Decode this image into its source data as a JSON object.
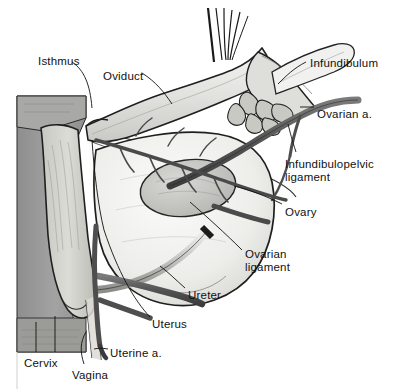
{
  "figure": {
    "background_color": "#ffffff",
    "ink_color": "#111111",
    "palette": {
      "panel_gray": "#9a9a9a",
      "tissue_light": "#e9e9e6",
      "tissue_mid": "#cccccc",
      "vessel_dark": "#5e5e5e",
      "outline": "#1a1a1a"
    }
  },
  "labels": [
    {
      "id": "isthmus",
      "text": "Isthmus",
      "x": 38,
      "y": 55,
      "align": "left"
    },
    {
      "id": "oviduct",
      "text": "Oviduct",
      "x": 103,
      "y": 70,
      "align": "left"
    },
    {
      "id": "infundibulum",
      "text": "Infundibulum",
      "x": 310,
      "y": 57,
      "align": "left"
    },
    {
      "id": "ovarian-artery",
      "text": "Ovarian a.",
      "x": 317,
      "y": 108,
      "align": "left"
    },
    {
      "id": "infundibulopelvic-ligament",
      "text": "Infundibulopelvic\nligament",
      "x": 285,
      "y": 158,
      "align": "left"
    },
    {
      "id": "ovary",
      "text": "Ovary",
      "x": 285,
      "y": 206,
      "align": "left"
    },
    {
      "id": "ovarian-ligament",
      "text": "Ovarian\nligament",
      "x": 245,
      "y": 248,
      "align": "left"
    },
    {
      "id": "ureter",
      "text": "Ureter",
      "x": 188,
      "y": 289,
      "align": "left"
    },
    {
      "id": "uterus",
      "text": "Uterus",
      "x": 152,
      "y": 318,
      "align": "left"
    },
    {
      "id": "uterine-artery",
      "text": "Uterine a.",
      "x": 110,
      "y": 347,
      "align": "left"
    },
    {
      "id": "cervix",
      "text": "Cervix",
      "x": 24,
      "y": 357,
      "align": "left"
    },
    {
      "id": "vagina",
      "text": "Vagina",
      "x": 72,
      "y": 369,
      "align": "left"
    }
  ],
  "structures": [
    {
      "id": "oviduct-tube",
      "name": "Oviduct (fallopian tube)"
    },
    {
      "id": "infundibulum-fimbriae",
      "name": "Infundibulum with fimbriae"
    },
    {
      "id": "ovary-body",
      "name": "Ovary"
    },
    {
      "id": "uterus-body",
      "name": "Uterine corpus"
    },
    {
      "id": "cervix-body",
      "name": "Cervix"
    },
    {
      "id": "vagina-canal",
      "name": "Vagina"
    },
    {
      "id": "broad-ligament",
      "name": "Broad ligament / mesosalpinx"
    },
    {
      "id": "ovarian-artery-vessel",
      "name": "Ovarian artery"
    },
    {
      "id": "uterine-artery-vessel",
      "name": "Uterine artery"
    },
    {
      "id": "ureter-tube",
      "name": "Ureter"
    },
    {
      "id": "suture-threads",
      "name": "Suture threads"
    },
    {
      "id": "pelvic-wall-panel",
      "name": "Sagittal pelvic wall section"
    }
  ]
}
